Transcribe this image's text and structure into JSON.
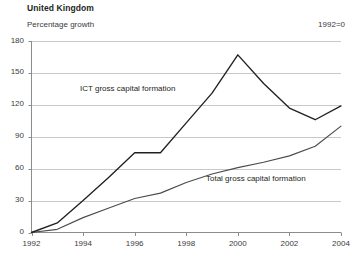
{
  "header": {
    "title": "United Kingdom",
    "subtitle": "Percentage growth",
    "note": "1992=0"
  },
  "chart_data": {
    "type": "line",
    "title": "United Kingdom",
    "subtitle": "Percentage growth",
    "annotation": "1992=0",
    "xlabel": "",
    "ylabel": "Percentage growth",
    "x": [
      1992,
      1993,
      1994,
      1995,
      1996,
      1997,
      1998,
      1999,
      2000,
      2001,
      2002,
      2003,
      2004
    ],
    "xlim": [
      1992,
      2004
    ],
    "ylim": [
      0,
      180
    ],
    "yticks": [
      0,
      30,
      60,
      90,
      120,
      150,
      180
    ],
    "xticks": [
      1992,
      1994,
      1996,
      1998,
      2000,
      2002,
      2004
    ],
    "xtick_labels": [
      "1992",
      "1994",
      "1996",
      "1998",
      "2000",
      "2002",
      "2004"
    ],
    "ytick_labels": [
      "0",
      "30",
      "60",
      "90",
      "120",
      "150",
      "180"
    ],
    "grid": "horizontal",
    "legend": "inline-labels",
    "series": [
      {
        "name": "ICT gross capital formation",
        "label_position": "inline",
        "values": [
          0,
          9,
          30,
          52,
          75,
          75,
          103,
          131,
          167,
          140,
          117,
          106,
          119
        ]
      },
      {
        "name": "Total gross capital formation",
        "label_position": "inline",
        "values": [
          0,
          3,
          14,
          23,
          32,
          37,
          47,
          55,
          61,
          66,
          72,
          81,
          100
        ]
      }
    ]
  },
  "colors": {
    "ict_line": "#231f20",
    "total_line": "#4c4c4c",
    "grid": "#c8c8c8",
    "axis": "#8c8c8c",
    "text": "#231f20"
  }
}
